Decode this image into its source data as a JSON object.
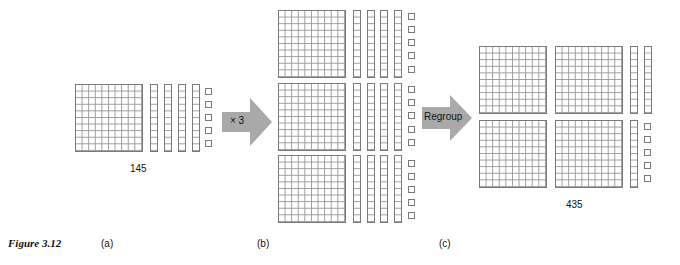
{
  "figure": {
    "label": "Figure 3.12",
    "panels": [
      {
        "id": "a",
        "caption": "(a)",
        "value_label": "145",
        "flats": 1,
        "rods": 4,
        "units": 5
      },
      {
        "id": "b",
        "caption": "(b)",
        "value_label": "",
        "flats": 3,
        "rods": 12,
        "units": 15
      },
      {
        "id": "c",
        "caption": "(c)",
        "value_label": "435",
        "flats": 4,
        "rods": 3,
        "units": 5
      }
    ],
    "arrows": [
      {
        "label": "× 3"
      },
      {
        "label": "Regroup"
      }
    ]
  },
  "colors": {
    "block_line": "#7a7a7a",
    "arrow_fill": "#a9a9a9",
    "text": "#111111"
  }
}
